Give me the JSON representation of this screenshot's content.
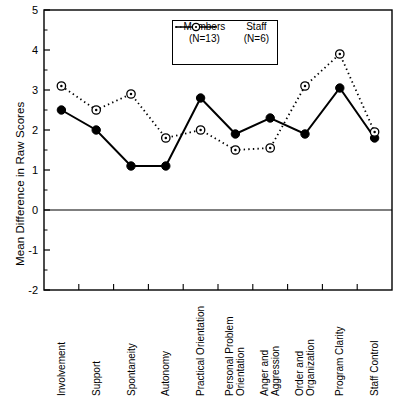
{
  "chart_data": {
    "type": "line",
    "title": "",
    "xlabel": "",
    "ylabel": "Mean Difference in Raw Scores",
    "ylim": [
      -2,
      5
    ],
    "ytick_labels": [
      "5",
      "4",
      "3",
      "2",
      "1",
      "0",
      "-1",
      "-2"
    ],
    "yticks": [
      5,
      4,
      3,
      2,
      1,
      0,
      -1,
      -2
    ],
    "minor_ticks": true,
    "grid": false,
    "zero_line": true,
    "legend_position": "top-center",
    "categories": [
      "Involvement",
      "Support",
      "Spontaneity",
      "Autonomy",
      "Practical Orientation",
      "Personal Problem\nOrientation",
      "Anger and\nAggression",
      "Order and\nOrganization",
      "Program Clarity",
      "Staff Control"
    ],
    "series": [
      {
        "name": "Members",
        "n_label": "(N=13)",
        "n": 13,
        "style": "solid",
        "marker": "filled-circle",
        "color": "#000000",
        "values": [
          2.5,
          2.0,
          1.1,
          1.1,
          2.8,
          1.9,
          2.3,
          1.9,
          3.05,
          1.8
        ]
      },
      {
        "name": "Staff",
        "n_label": "(N=6)",
        "n": 6,
        "style": "dotted",
        "marker": "open-circle",
        "color": "#000000",
        "values": [
          3.1,
          2.5,
          2.9,
          1.8,
          2.0,
          1.5,
          1.55,
          3.1,
          3.9,
          1.95
        ]
      }
    ]
  },
  "legend": {
    "header": [
      "Members",
      "Staff"
    ],
    "subheader": [
      "(N=13)",
      "(N=6)"
    ]
  }
}
